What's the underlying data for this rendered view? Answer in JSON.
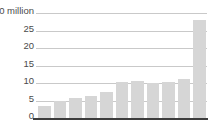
{
  "chart_data": {
    "type": "bar",
    "title": "",
    "subtitle": "",
    "xlabel": "",
    "ylabel": "$30 million",
    "unit_label": "$30 million",
    "categories": [
      "1",
      "2",
      "3",
      "4",
      "5",
      "6",
      "7",
      "8",
      "9",
      "10",
      "11"
    ],
    "values": [
      3.5,
      5.0,
      5.6,
      6.3,
      7.5,
      10.2,
      10.7,
      9.9,
      10.4,
      11.2,
      28.0
    ],
    "ylim": [
      0,
      30
    ],
    "y_ticks": [
      0,
      5,
      10,
      15,
      20,
      25,
      30
    ],
    "y_tick_labels": [
      "0",
      "5",
      "10",
      "15",
      "20",
      "25",
      "$30 million"
    ],
    "x_tick_labels": [],
    "grid": true,
    "legend": false,
    "legend_position": "none",
    "bar_color": "#d6d6d6",
    "grid_color": "#c9c9c9",
    "axis_color": "#3d3d3d",
    "text_color": "#4a4a4a",
    "background": "#ffffff"
  },
  "axis": {
    "tick_30": "$30 million",
    "tick_25": "25",
    "tick_20": "20",
    "tick_15": "15",
    "tick_10": "10",
    "tick_5": "5",
    "tick_0": "0"
  }
}
